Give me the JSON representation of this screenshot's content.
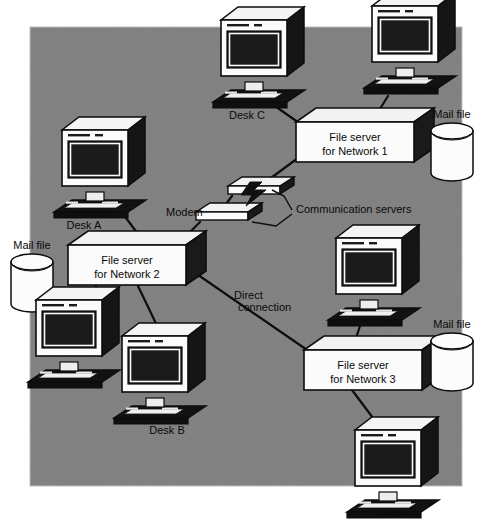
{
  "diagram": {
    "canvas": {
      "width": 490,
      "height": 524
    },
    "panel": {
      "x": 30,
      "y": 27,
      "width": 432,
      "height": 459,
      "fill": "#808080",
      "stroke": "#d9d9d9"
    },
    "colors": {
      "background": "#ffffff",
      "panel_gray": "#808080",
      "box_face": "#fbfbfb",
      "box_top": "#f2f2f2",
      "box_side": "#1a1a1a",
      "screen": "#141414",
      "outline": "#0d0d0d",
      "line": "#0d0d0d",
      "text": "#0a0a0a"
    }
  },
  "servers": [
    {
      "id": "server1",
      "line1": "File server",
      "line2": "for Network 1",
      "x": 296,
      "y": 122,
      "w": 118,
      "h": 40
    },
    {
      "id": "server2",
      "line1": "File server",
      "line2": "for Network 2",
      "x": 68,
      "y": 245,
      "w": 118,
      "h": 40
    },
    {
      "id": "server3",
      "line1": "File server",
      "line2": "for Network 3",
      "x": 304,
      "y": 350,
      "w": 118,
      "h": 40
    }
  ],
  "mail_files": [
    {
      "id": "mailfile-left",
      "label": "Mail file",
      "cx": 32,
      "cy": 262,
      "rx": 21,
      "ry": 8,
      "body": 42
    },
    {
      "id": "mailfile-network1",
      "label": "Mail file",
      "cx": 452,
      "cy": 131,
      "rx": 21,
      "ry": 8,
      "body": 42
    },
    {
      "id": "mailfile-network3",
      "label": "Mail file",
      "cx": 452,
      "cy": 341,
      "rx": 21,
      "ry": 8,
      "body": 42
    }
  ],
  "computers": [
    {
      "id": "computer-desk-c",
      "label": "Desk C",
      "x": 221,
      "y": 20,
      "scale": 1.0
    },
    {
      "id": "computer-network1-nw",
      "label": "",
      "x": 372,
      "y": 6,
      "scale": 1.0
    },
    {
      "id": "computer-desk-a",
      "label": "Desk A",
      "x": 62,
      "y": 130,
      "scale": 1.0
    },
    {
      "id": "computer-network3-ne",
      "label": "",
      "x": 336,
      "y": 238,
      "scale": 1.0
    },
    {
      "id": "computer-network2-w",
      "label": "",
      "x": 36,
      "y": 300,
      "scale": 1.0
    },
    {
      "id": "computer-desk-b",
      "label": "Desk B",
      "x": 122,
      "y": 336,
      "scale": 1.0
    },
    {
      "id": "computer-desk-d",
      "label": "Desk D",
      "x": 355,
      "y": 430,
      "scale": 1.0
    }
  ],
  "comm_devices": [
    {
      "id": "comm-server-upper",
      "x": 228,
      "y": 186,
      "w": 52,
      "h": 8
    },
    {
      "id": "comm-server-lower",
      "x": 196,
      "y": 212,
      "w": 52,
      "h": 8
    }
  ],
  "annotations": [
    {
      "id": "label-modem",
      "text": "Modem",
      "x": 166,
      "y": 216,
      "anchor": "start"
    },
    {
      "id": "label-communication-servers",
      "text": "Communication servers",
      "x": 296,
      "y": 213,
      "anchor": "start"
    },
    {
      "id": "label-direct-connection-1",
      "text": "Direct",
      "x": 234,
      "y": 299,
      "anchor": "start"
    },
    {
      "id": "label-direct-connection-2",
      "text": "connection",
      "x": 238,
      "y": 311,
      "anchor": "start"
    }
  ],
  "desk_labels": [
    {
      "id": "desk-label-c",
      "text": "Desk C",
      "x": 247,
      "y": 119
    },
    {
      "id": "desk-label-a",
      "text": "Desk A",
      "x": 84,
      "y": 229
    },
    {
      "id": "desk-label-b",
      "text": "Desk B",
      "x": 167,
      "y": 434
    },
    {
      "id": "desk-label-d",
      "text": "Desk D",
      "x": 399,
      "y": 516
    }
  ],
  "connections": [
    {
      "id": "link-deskc-server1",
      "from": "computer-desk-c",
      "to": "server1",
      "points": "272,104 312,132"
    },
    {
      "id": "link-nw-server1",
      "from": "computer-network1-nw",
      "to": "server1",
      "points": "388,96 368,128"
    },
    {
      "id": "link-comm-server1",
      "from": "comm-server-upper",
      "to": "server1",
      "points": "256,189 298,158"
    },
    {
      "id": "link-comm-upper-lower",
      "from": "comm-server-upper",
      "to": "comm-server-lower",
      "points": "232,196 220,212"
    },
    {
      "id": "link-deska-server2",
      "from": "computer-desk-a",
      "to": "server2",
      "points": "126,218 150,250"
    },
    {
      "id": "link-modem-server2",
      "from": "comm-server-lower",
      "to": "server2",
      "points": "200,222 176,246"
    },
    {
      "id": "link-server2-west",
      "from": "server2",
      "to": "computer-network2-w",
      "points": "96,286 90,300"
    },
    {
      "id": "link-server2-deskb",
      "from": "server2",
      "to": "computer-desk-b",
      "points": "138,286 162,336"
    },
    {
      "id": "link-server2-direct",
      "from": "server2",
      "to": "server3",
      "points": "188,268 310,352"
    },
    {
      "id": "link-ne-server3",
      "from": "computer-network3-ne",
      "to": "server3",
      "points": "362,320 350,356"
    },
    {
      "id": "link-server3-deskd",
      "from": "server3",
      "to": "computer-desk-d",
      "points": "352,390 382,430"
    }
  ]
}
